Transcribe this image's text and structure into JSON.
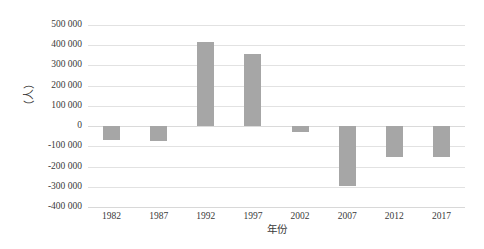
{
  "chart_data": {
    "type": "bar",
    "title": "",
    "subtitle": "",
    "xlabel": "年份",
    "ylabel": "（人）",
    "categories": [
      "1982",
      "1987",
      "1992",
      "1997",
      "2002",
      "2007",
      "2012",
      "2017"
    ],
    "values": [
      -70000,
      -75000,
      415000,
      355000,
      -30000,
      -295000,
      -155000,
      -155000
    ],
    "series": [
      {
        "name": "",
        "values": [
          -70000,
          -75000,
          415000,
          355000,
          -30000,
          -295000,
          -155000,
          -155000
        ]
      }
    ],
    "ylim": [
      -400000,
      500000
    ],
    "ytick_step": 100000,
    "ytick_labels": [
      "500 000",
      "400 000",
      "300 000",
      "200 000",
      "100 000",
      "0",
      "-100 000",
      "-200 000",
      "-300 000",
      "-400 000"
    ],
    "ytick_values": [
      500000,
      400000,
      300000,
      200000,
      100000,
      0,
      -100000,
      -200000,
      -300000,
      -400000
    ],
    "grid": true,
    "grid_axis": "y",
    "legend": false,
    "legend_position": "none",
    "bar_color": "#a6a6a6",
    "gridline_color": "#e2e2e2",
    "text_color": "#3a3a3a",
    "background_color": "#ffffff"
  }
}
